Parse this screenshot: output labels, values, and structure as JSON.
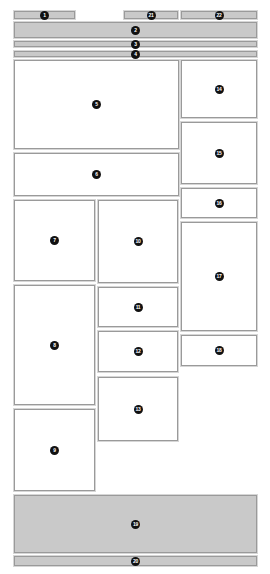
{
  "diagram": {
    "type": "wireframe-layout",
    "colors": {
      "filled": "#c9c9c9",
      "empty": "#ffffff",
      "border": "#9a9a9a",
      "marker": "#111111"
    },
    "regions": [
      {
        "id": "1",
        "label": "1",
        "fill": "gray",
        "x": 14,
        "y": 11,
        "w": 61,
        "h": 8
      },
      {
        "id": "21",
        "label": "21",
        "fill": "gray",
        "x": 124,
        "y": 11,
        "w": 54,
        "h": 8
      },
      {
        "id": "22",
        "label": "22",
        "fill": "gray",
        "x": 181,
        "y": 11,
        "w": 76,
        "h": 8
      },
      {
        "id": "2",
        "label": "2",
        "fill": "gray",
        "x": 14,
        "y": 22,
        "w": 243,
        "h": 16
      },
      {
        "id": "3",
        "label": "3",
        "fill": "gray",
        "x": 14,
        "y": 41,
        "w": 243,
        "h": 6
      },
      {
        "id": "4",
        "label": "4",
        "fill": "gray",
        "x": 14,
        "y": 51,
        "w": 243,
        "h": 6
      },
      {
        "id": "5",
        "label": "5",
        "fill": "white",
        "x": 14,
        "y": 60,
        "w": 165,
        "h": 89
      },
      {
        "id": "6",
        "label": "6",
        "fill": "white",
        "x": 14,
        "y": 153,
        "w": 165,
        "h": 43
      },
      {
        "id": "7",
        "label": "7",
        "fill": "white",
        "x": 14,
        "y": 200,
        "w": 81,
        "h": 81
      },
      {
        "id": "8",
        "label": "8",
        "fill": "white",
        "x": 14,
        "y": 285,
        "w": 81,
        "h": 120
      },
      {
        "id": "9",
        "label": "9",
        "fill": "white",
        "x": 14,
        "y": 409,
        "w": 81,
        "h": 82
      },
      {
        "id": "10",
        "label": "10",
        "fill": "white",
        "x": 98,
        "y": 200,
        "w": 80,
        "h": 83
      },
      {
        "id": "11",
        "label": "11",
        "fill": "white",
        "x": 98,
        "y": 287,
        "w": 80,
        "h": 40
      },
      {
        "id": "12",
        "label": "12",
        "fill": "white",
        "x": 98,
        "y": 331,
        "w": 80,
        "h": 41
      },
      {
        "id": "13",
        "label": "13",
        "fill": "white",
        "x": 98,
        "y": 377,
        "w": 80,
        "h": 64
      },
      {
        "id": "14",
        "label": "14",
        "fill": "white",
        "x": 181,
        "y": 60,
        "w": 76,
        "h": 58
      },
      {
        "id": "15",
        "label": "15",
        "fill": "white",
        "x": 181,
        "y": 122,
        "w": 76,
        "h": 62
      },
      {
        "id": "16",
        "label": "16",
        "fill": "white",
        "x": 181,
        "y": 188,
        "w": 76,
        "h": 30
      },
      {
        "id": "17",
        "label": "17",
        "fill": "white",
        "x": 181,
        "y": 222,
        "w": 76,
        "h": 109
      },
      {
        "id": "18",
        "label": "18",
        "fill": "white",
        "x": 181,
        "y": 335,
        "w": 76,
        "h": 31
      },
      {
        "id": "19",
        "label": "19",
        "fill": "gray",
        "x": 14,
        "y": 495,
        "w": 243,
        "h": 58
      },
      {
        "id": "20",
        "label": "20",
        "fill": "gray",
        "x": 14,
        "y": 556,
        "w": 243,
        "h": 10
      }
    ]
  }
}
